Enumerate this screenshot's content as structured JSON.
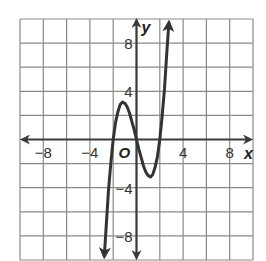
{
  "chart_data": {
    "type": "line",
    "title": "",
    "xlabel": "x",
    "ylabel": "y",
    "origin_label": "O",
    "xlim": [
      -10,
      10
    ],
    "ylim": [
      -10,
      10
    ],
    "grid": true,
    "grid_step": 2,
    "x_ticks": [
      {
        "value": -8,
        "label": "−8"
      },
      {
        "value": -4,
        "label": "−4"
      },
      {
        "value": 4,
        "label": "4"
      },
      {
        "value": 8,
        "label": "8"
      }
    ],
    "y_ticks": [
      {
        "value": 8,
        "label": "8"
      },
      {
        "value": 4,
        "label": "4"
      },
      {
        "value": -4,
        "label": "−4"
      },
      {
        "value": -8,
        "label": "−8"
      }
    ],
    "series": [
      {
        "name": "cubic",
        "description": "y = x^3 - 4x (roughly), zeros near -2, 0, 2; local max about 3 near x=-1, local min about -3 near x=1",
        "x": [
          -2.6,
          -2.4,
          -2.2,
          -2.0,
          -1.8,
          -1.6,
          -1.4,
          -1.2,
          -1.0,
          -0.8,
          -0.6,
          -0.4,
          -0.2,
          0.0,
          0.2,
          0.4,
          0.6,
          0.8,
          1.0,
          1.2,
          1.4,
          1.6,
          1.8,
          2.0,
          2.2,
          2.4,
          2.6,
          2.8,
          3.0
        ],
        "y": [
          -7.2,
          -4.2,
          -1.9,
          0.0,
          1.4,
          2.3,
          2.9,
          3.1,
          3.0,
          2.7,
          2.2,
          1.5,
          0.8,
          0.0,
          -0.8,
          -1.5,
          -2.2,
          -2.7,
          -3.0,
          -3.1,
          -2.9,
          -2.3,
          -1.4,
          0.0,
          1.9,
          4.2,
          7.2,
          10.0,
          12.0
        ],
        "arrows": "both-ends"
      }
    ]
  }
}
